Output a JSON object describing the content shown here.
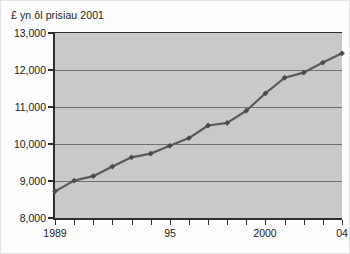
{
  "chart_data": {
    "type": "line",
    "title": "£ yn ôl prisiau 2001",
    "xlabel": "",
    "ylabel": "",
    "grid": "horizontal",
    "legend": "none",
    "xlim": [
      1989,
      2004
    ],
    "ylim": [
      8000,
      13000
    ],
    "x": [
      1989,
      1990,
      1991,
      1992,
      1993,
      1994,
      1995,
      1996,
      1997,
      1998,
      1999,
      2000,
      2001,
      2002,
      2003,
      2004
    ],
    "x_tick_values": [
      1989,
      1990,
      1991,
      1992,
      1993,
      1994,
      1995,
      1996,
      1997,
      1998,
      1999,
      2000,
      2001,
      2002,
      2003,
      2004
    ],
    "x_tick_labels": [
      "1989",
      "",
      "",
      "",
      "",
      "",
      "95",
      "",
      "",
      "",
      "",
      "2000",
      "",
      "",
      "",
      "04"
    ],
    "y_tick_values": [
      8000,
      9000,
      10000,
      11000,
      12000,
      13000
    ],
    "y_tick_labels": [
      "8,000",
      "9,000",
      "10,000",
      "11,000",
      "12,000",
      "13,000"
    ],
    "series": [
      {
        "name": "£ yn ôl prisiau 2001",
        "values": [
          8720,
          9010,
          9130,
          9390,
          9640,
          9740,
          9950,
          10160,
          10500,
          10570,
          10900,
          11370,
          11790,
          11930,
          12200,
          12450
        ]
      }
    ],
    "colors": {
      "line": "#595959",
      "marker": "#4a4a4a",
      "plot_background": "#c9c9c9",
      "gridline": "#6f6f6f",
      "axis": "#2e2e2e",
      "text": "#1b1b1b",
      "figure_background": "#fdfdfd"
    },
    "marker_style": "diamond",
    "line_width": 2.2
  }
}
